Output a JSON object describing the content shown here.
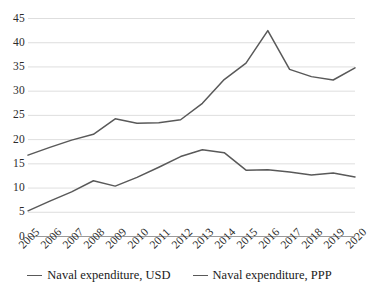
{
  "chart_data": {
    "type": "line",
    "title": "",
    "xlabel": "",
    "ylabel": "",
    "categories": [
      "2005",
      "2006",
      "2007",
      "2008",
      "2009",
      "2010",
      "2011",
      "2012",
      "2013",
      "2014",
      "2015",
      "2016",
      "2017",
      "2018",
      "2019",
      "2020"
    ],
    "yticks": [
      0,
      5,
      10,
      15,
      20,
      25,
      30,
      35,
      40,
      45
    ],
    "ylim": [
      0,
      45
    ],
    "grid": true,
    "legend_position": "bottom",
    "series": [
      {
        "name": "Naval expenditure, USD",
        "color": "#595959",
        "values": [
          5.3,
          7.3,
          9.2,
          11.5,
          10.4,
          12.2,
          14.3,
          16.5,
          17.9,
          17.3,
          13.7,
          13.8,
          13.3,
          12.7,
          13.1,
          12.3
        ]
      },
      {
        "name": "Naval expenditure, PPP",
        "color": "#595959",
        "values": [
          16.8,
          18.4,
          19.9,
          21.1,
          24.3,
          23.4,
          23.5,
          24.1,
          27.5,
          32.4,
          35.8,
          42.5,
          34.5,
          33.0,
          32.3,
          34.8
        ]
      }
    ]
  },
  "axes": {
    "y_tick_labels": [
      "45",
      "40",
      "35",
      "30",
      "25",
      "20",
      "15",
      "10",
      "5",
      "0"
    ],
    "x_tick_labels": [
      "2005",
      "2006",
      "2007",
      "2008",
      "2009",
      "2010",
      "2011",
      "2012",
      "2013",
      "2014",
      "2015",
      "2016",
      "2017",
      "2018",
      "2019",
      "2020"
    ]
  },
  "legend": {
    "items": [
      {
        "label": "Naval expenditure, USD"
      },
      {
        "label": "Naval expenditure, PPP"
      }
    ]
  }
}
